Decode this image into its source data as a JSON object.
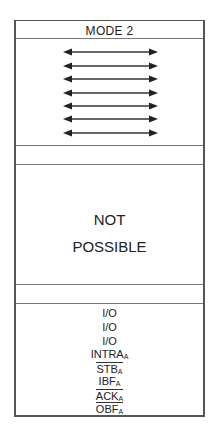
{
  "header": {
    "title": "MODE 2"
  },
  "arrows": {
    "count": 7,
    "icon": "double-headed-arrow-icon"
  },
  "middle": {
    "line1": "NOT",
    "line2": "POSSIBLE"
  },
  "pins": [
    {
      "label": "I/O",
      "sub": "",
      "overline": false
    },
    {
      "label": "I/O",
      "sub": "",
      "overline": false
    },
    {
      "label": "I/O",
      "sub": "",
      "overline": false
    },
    {
      "label": "INTRA",
      "sub": "A",
      "overline": false
    },
    {
      "label": "STB",
      "sub": "A",
      "overline": true
    },
    {
      "label": "IBF",
      "sub": "A",
      "overline": false
    },
    {
      "label": "ACK",
      "sub": "A",
      "overline": true
    },
    {
      "label": "OBF",
      "sub": "A",
      "overline": true
    }
  ]
}
